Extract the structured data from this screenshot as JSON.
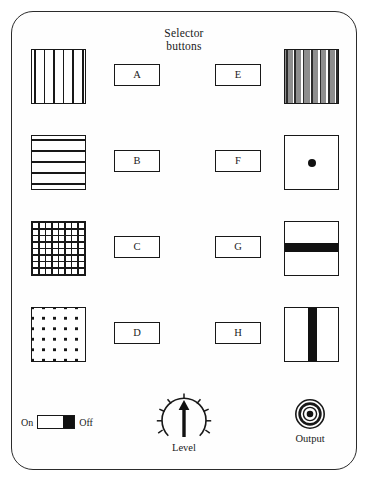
{
  "panel": {
    "heading_line1": "Selector",
    "heading_line2": "buttons",
    "border_color": "#2b2b2b",
    "background_color": "#fefefe"
  },
  "selectors": [
    {
      "label": "A",
      "side": "left",
      "row": 1,
      "pattern": "vertical-lines",
      "pattern_name": "vertical-stripes-swatch"
    },
    {
      "label": "B",
      "side": "left",
      "row": 2,
      "pattern": "horizontal-lines",
      "pattern_name": "horizontal-stripes-swatch"
    },
    {
      "label": "C",
      "side": "left",
      "row": 3,
      "pattern": "grid",
      "pattern_name": "grid-mesh-swatch"
    },
    {
      "label": "D",
      "side": "left",
      "row": 4,
      "pattern": "dot-matrix",
      "pattern_name": "dot-matrix-swatch"
    },
    {
      "label": "E",
      "side": "right",
      "row": 1,
      "pattern": "dithered-vertical-bands",
      "pattern_name": "dithered-stripes-swatch"
    },
    {
      "label": "F",
      "side": "right",
      "row": 2,
      "pattern": "center-dot",
      "pattern_name": "center-dot-swatch"
    },
    {
      "label": "G",
      "side": "right",
      "row": 3,
      "pattern": "horizontal-bar",
      "pattern_name": "horizontal-bar-swatch"
    },
    {
      "label": "H",
      "side": "right",
      "row": 4,
      "pattern": "vertical-bar",
      "pattern_name": "vertical-bar-swatch"
    }
  ],
  "power_switch": {
    "on_label": "On",
    "off_label": "Off",
    "state": "Off",
    "knob_color": "#111111"
  },
  "level_control": {
    "label": "Level",
    "pointer_direction": "up",
    "pointer_angle_deg": 0,
    "tick_count": 9
  },
  "output_jack": {
    "label": "Output",
    "type": "coaxial-jack"
  },
  "colors": {
    "ink": "#181818",
    "paper": "#ffffff",
    "gray": "#8e8e8e"
  }
}
